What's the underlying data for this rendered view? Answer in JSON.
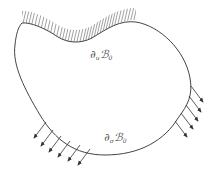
{
  "diagram": {
    "type": "continuum-body-boundary-conditions",
    "body": "B_0",
    "labels": {
      "displacement_boundary": {
        "partial": "∂",
        "sub1": "u",
        "body": "ℬ",
        "sub2": "0"
      },
      "traction_boundary": {
        "partial": "∂",
        "sub1": "σ",
        "body": "ℬ",
        "sub2": "0"
      }
    },
    "colors": {
      "outline": "#444444",
      "hatch": "#777777",
      "arrow": "#333333",
      "label": "#555555"
    },
    "traction_arrows": {
      "left_group_count": 6,
      "right_group_count": 5
    }
  }
}
